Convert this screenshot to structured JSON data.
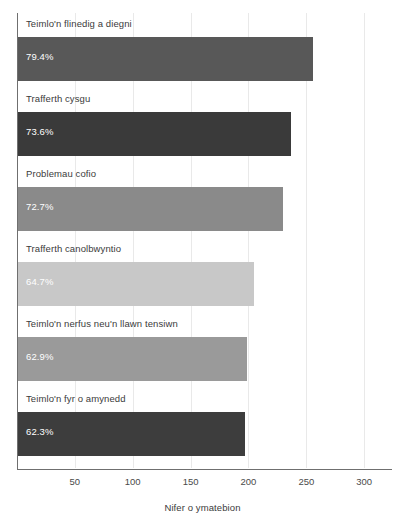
{
  "chart_data": {
    "type": "bar",
    "orientation": "horizontal",
    "title": "",
    "xlabel": "Nifer o ymatebion",
    "ylabel": "",
    "xlim": [
      0,
      324
    ],
    "xticks": [
      50,
      100,
      150,
      200,
      250,
      300
    ],
    "xtick_labels": [
      "50",
      "100",
      "150",
      "200",
      "250",
      "300"
    ],
    "grid": true,
    "legend": "none",
    "categories": [
      "Teimlo'n flinedig a diegni",
      "Trafferth cysgu",
      "Problemau cofio",
      "Trafferth canolbwyntio",
      "Teimlo'n nerfus neu'n llawn tensiwn",
      "Teimlo'n fyr o amynedd"
    ],
    "values": [
      256,
      237,
      230,
      205,
      199,
      197
    ],
    "data_labels": [
      "79.4%",
      "73.6%",
      "72.7%",
      "64.7%",
      "62.9%",
      "62.3%"
    ],
    "bar_colors": [
      "#585858",
      "#3a3a3a",
      "#8a8a8a",
      "#c8c8c8",
      "#9a9a9a",
      "#3d3d3d"
    ]
  },
  "axis": {
    "x_title": "Nifer o ymatebion",
    "ticks": [
      "50",
      "100",
      "150",
      "200",
      "250",
      "300"
    ]
  },
  "bars": [
    {
      "label": "Teimlo'n flinedig a diegni",
      "value": 256,
      "percent": "79.4%",
      "color": "#585858"
    },
    {
      "label": "Trafferth cysgu",
      "value": 237,
      "percent": "73.6%",
      "color": "#3a3a3a"
    },
    {
      "label": "Problemau cofio",
      "value": 230,
      "percent": "72.7%",
      "color": "#8a8a8a"
    },
    {
      "label": "Trafferth canolbwyntio",
      "value": 205,
      "percent": "64.7%",
      "color": "#c8c8c8"
    },
    {
      "label": "Teimlo'n nerfus neu'n llawn tensiwn",
      "value": 199,
      "percent": "62.9%",
      "color": "#9a9a9a"
    },
    {
      "label": "Teimlo'n fyr o amynedd",
      "value": 197,
      "percent": "62.3%",
      "color": "#3d3d3d"
    }
  ]
}
